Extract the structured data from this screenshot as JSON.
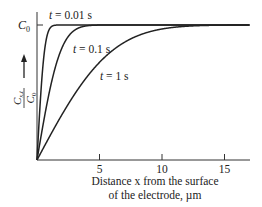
{
  "chart_data": {
    "type": "line",
    "title": "",
    "xlabel_line1": "Distance x from the surface",
    "xlabel_line2": "of the electrode, µm",
    "ylabel": "C_{x,t} / C_0",
    "ylabel_num": "C",
    "ylabel_num_sub": "x,t",
    "ylabel_den": "C",
    "ylabel_den_sub": "0",
    "y_top_label": "C",
    "y_top_label_sub": "0",
    "xlim": [
      0,
      17
    ],
    "ylim": [
      0,
      1
    ],
    "x_ticks": [
      5,
      10,
      15
    ],
    "x_tick_labels": [
      "5",
      "10",
      "15"
    ],
    "grid": false,
    "legend": "inline annotations",
    "model": "C/C0 = erf(x / (2*sqrt(D t)))",
    "sqrt_D_um_per_sqrt_s": 3.25,
    "series": [
      {
        "name": "t = 0.01 s",
        "t": 0.01,
        "label_x": 3.2,
        "label_y": 1.07,
        "x": [
          0,
          0.1,
          0.2,
          0.3,
          0.5,
          0.7,
          1.0,
          1.5,
          16
        ],
        "values": [
          0,
          0.17,
          0.33,
          0.48,
          0.72,
          0.87,
          0.97,
          1.0,
          1.0
        ]
      },
      {
        "name": "t = 0.1 s",
        "t": 0.1,
        "label_x": 8.2,
        "label_y": 0.79,
        "x": [
          0,
          0.5,
          1,
          1.5,
          2,
          3,
          4,
          5,
          6,
          16
        ],
        "values": [
          0,
          0.27,
          0.51,
          0.7,
          0.83,
          0.96,
          0.99,
          1.0,
          1.0,
          1.0
        ]
      },
      {
        "name": "t = 1 s",
        "t": 1,
        "label_x": 9.8,
        "label_y": 0.53,
        "x": [
          0,
          1,
          2,
          3,
          4,
          5,
          6,
          8,
          10,
          12,
          14,
          16
        ],
        "values": [
          0,
          0.17,
          0.33,
          0.48,
          0.62,
          0.73,
          0.81,
          0.92,
          0.97,
          0.99,
          1.0,
          1.0
        ]
      }
    ]
  }
}
